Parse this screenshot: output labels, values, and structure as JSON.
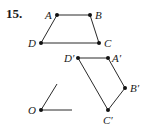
{
  "problem": {
    "number": "15."
  },
  "figure": {
    "original": {
      "points": [
        {
          "name": "A",
          "label": "A",
          "x": 57,
          "y": 15
        },
        {
          "name": "B",
          "label": "B",
          "x": 90,
          "y": 15
        },
        {
          "name": "C",
          "label": "C",
          "x": 99,
          "y": 43
        },
        {
          "name": "D",
          "label": "D",
          "x": 41,
          "y": 43
        }
      ]
    },
    "image": {
      "points": [
        {
          "name": "A-prime",
          "label": "A′",
          "x": 108,
          "y": 58
        },
        {
          "name": "B-prime",
          "label": "B′",
          "x": 125,
          "y": 88
        },
        {
          "name": "C-prime",
          "label": "C′",
          "x": 108,
          "y": 110
        },
        {
          "name": "D-prime",
          "label": "D′",
          "x": 78,
          "y": 58
        }
      ]
    },
    "center": {
      "label": "O",
      "x": 41,
      "y": 110
    },
    "colors": {
      "stroke": "#2a2a2a",
      "point": "#111111"
    }
  }
}
